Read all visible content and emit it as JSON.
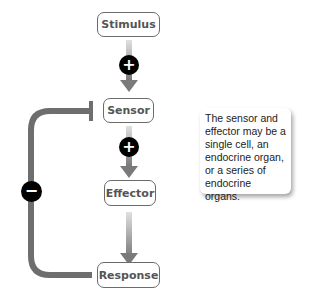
{
  "nodes": {
    "stimulus": "Stimulus",
    "sensor": "Sensor",
    "effector": "Effector",
    "response": "Response"
  },
  "signs": {
    "stimulus_to_sensor": "+",
    "sensor_to_effector": "+",
    "feedback": "−"
  },
  "note": "The sensor and effector may be a single cell, an endocrine organ, or a series of endocrine organs.",
  "colors": {
    "arrow": "#7a7a7a",
    "sign_bg": "#000000",
    "box_border": "#6b6b6b"
  }
}
